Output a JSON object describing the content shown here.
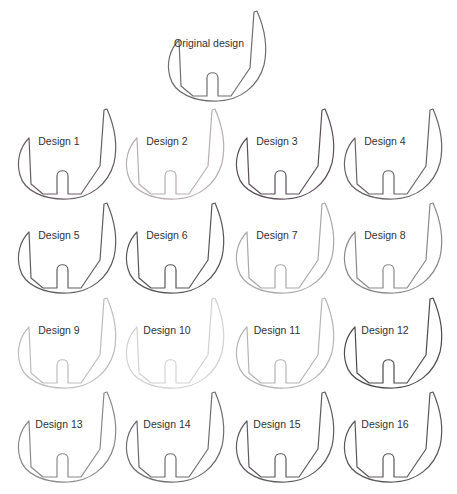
{
  "original": {
    "label": "Original design",
    "stroke": "#6f6f6f",
    "x": 160,
    "y": 7
  },
  "designs": [
    {
      "label": "Design 1",
      "stroke": "#6a5e66",
      "x": 10,
      "y": 105
    },
    {
      "label": "Design 2",
      "stroke": "#b9aeb3",
      "x": 118,
      "y": 105
    },
    {
      "label": "Design 3",
      "stroke": "#5d4f5a",
      "x": 228,
      "y": 105
    },
    {
      "label": "Design 4",
      "stroke": "#6a6468",
      "x": 336,
      "y": 105
    },
    {
      "label": "Design 5",
      "stroke": "#5f5f5f",
      "x": 10,
      "y": 199
    },
    {
      "label": "Design 6",
      "stroke": "#575757",
      "x": 118,
      "y": 199
    },
    {
      "label": "Design 7",
      "stroke": "#a9a9a9",
      "x": 228,
      "y": 199
    },
    {
      "label": "Design 8",
      "stroke": "#8a8a8a",
      "x": 336,
      "y": 199
    },
    {
      "label": "Design 9",
      "stroke": "#bdbdbd",
      "x": 10,
      "y": 294
    },
    {
      "label": "Design 10",
      "stroke": "#d2d2d2",
      "x": 118,
      "y": 294
    },
    {
      "label": "Design 11",
      "stroke": "#b5b5b5",
      "x": 228,
      "y": 294
    },
    {
      "label": "Design 12",
      "stroke": "#4f4a4e",
      "x": 336,
      "y": 294
    },
    {
      "label": "Design 13",
      "stroke": "#8a8a8a",
      "x": 10,
      "y": 388
    },
    {
      "label": "Design 14",
      "stroke": "#6e6e6e",
      "x": 118,
      "y": 388
    },
    {
      "label": "Design 15",
      "stroke": "#5f5a60",
      "x": 228,
      "y": 388
    },
    {
      "label": "Design 16",
      "stroke": "#5b5659",
      "x": 336,
      "y": 388
    }
  ]
}
